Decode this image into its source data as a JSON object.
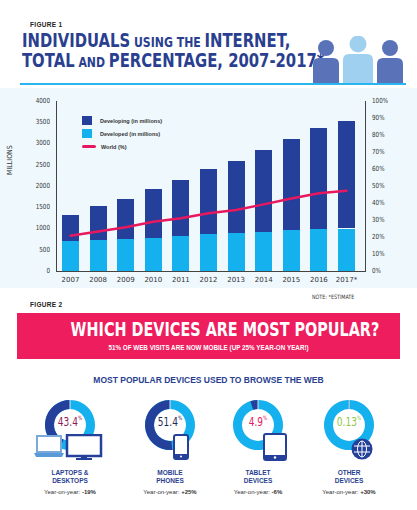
{
  "figure1": {
    "label": "FIGURE 1",
    "title_line1": [
      {
        "text": "INDIVIDUALS",
        "size": "big"
      },
      {
        "text": " USING THE ",
        "size": "small"
      },
      {
        "text": "INTERNET,",
        "size": "big"
      }
    ],
    "title_line2": [
      {
        "text": "TOTAL",
        "size": "big"
      },
      {
        "text": " AND ",
        "size": "small"
      },
      {
        "text": "PERCENTAGE, 2007-2017*",
        "size": "big"
      }
    ],
    "icon": "people-group-icon",
    "note": "NOTE: *ESTIMATE"
  },
  "chart_data": [
    {
      "type": "bar",
      "stacked": true,
      "title": "Individuals using the Internet, total and percentage, 2007-2017*",
      "categories": [
        "2007",
        "2008",
        "2009",
        "2010",
        "2011",
        "2012",
        "2013",
        "2014",
        "2015",
        "2016",
        "2017*"
      ],
      "ylabel": "MILLIONS",
      "ylim": [
        0,
        4000
      ],
      "yticks": [
        "0",
        "500",
        "1000",
        "1500",
        "2000",
        "2500",
        "3000",
        "3500",
        "4000"
      ],
      "y2lim": [
        0,
        100
      ],
      "y2ticks": [
        "0%",
        "10%",
        "20%",
        "30%",
        "40%",
        "50%",
        "60%",
        "70%",
        "80%",
        "90%",
        "100%"
      ],
      "legend_position": "upper-left",
      "grid": false,
      "series": [
        {
          "name": "Developed (in millions)",
          "type": "bar",
          "color": "#15b0ee",
          "values": [
            705,
            730,
            760,
            785,
            830,
            860,
            885,
            910,
            955,
            990,
            1000
          ]
        },
        {
          "name": "Developing (in millions)",
          "type": "bar",
          "color": "#24409a",
          "values": [
            615,
            800,
            930,
            1155,
            1300,
            1530,
            1705,
            1930,
            2145,
            2375,
            2535
          ]
        },
        {
          "name": "World (%)",
          "type": "line",
          "axis": "right",
          "color": "#e8185f",
          "values": [
            20.8,
            23.3,
            25.7,
            29.0,
            31.0,
            34.0,
            35.9,
            39.2,
            42.7,
            45.7,
            47.2
          ]
        }
      ],
      "note": "NOTE: *ESTIMATE"
    },
    {
      "type": "pie",
      "title": "Most popular devices used to browse the web",
      "categories": [
        "Laptops & Desktops",
        "Mobile Phones",
        "Tablet Devices",
        "Other Devices"
      ],
      "values": [
        43.4,
        51.4,
        4.9,
        0.13
      ],
      "year_on_year": [
        "-19%",
        "+25%",
        "-6%",
        "+30%"
      ]
    }
  ],
  "legend": [
    {
      "label": "Developing (in millions)",
      "color": "#24409a",
      "kind": "box"
    },
    {
      "label": "Developed (in millions)",
      "color": "#15b0ee",
      "kind": "box"
    },
    {
      "label": "World (%)",
      "color": "#e8185f",
      "kind": "line"
    }
  ],
  "figure2": {
    "label": "FIGURE 2",
    "banner_title": "WHICH DEVICES ARE MOST POPULAR?",
    "banner_subtitle": "51% OF WEB VISITS ARE NOW MOBILE (UP 25% YEAR-ON YEAR!)",
    "heading": "MOST POPULAR DEVICES USED TO BROWSE THE WEB",
    "yoy_prefix": "Year-on-year: ",
    "devices": [
      {
        "line1": "LAPTOPS &",
        "line2": "DESKTOPS",
        "pct": "43.4",
        "pct_color": "#8b1a57",
        "yoy": "-19%",
        "icon": "laptop-desktop-icon"
      },
      {
        "line1": "MOBILE",
        "line2": "PHONES",
        "pct": "51.4",
        "pct_color": "#1f2a5a",
        "yoy": "+25%",
        "icon": "smartphone-icon"
      },
      {
        "line1": "TABLET",
        "line2": "DEVICES",
        "pct": "4.9",
        "pct_color": "#e8185f",
        "yoy": "-6%",
        "icon": "tablet-icon"
      },
      {
        "line1": "OTHER",
        "line2": "DEVICES",
        "pct": "0.13",
        "pct_color": "#8dc63f",
        "yoy": "+30%",
        "icon": "globe-icon"
      }
    ]
  },
  "colors": {
    "dark_blue": "#24409a",
    "light_blue": "#15b0ee",
    "pink": "#ee1d5e",
    "title_blue": "#2a3f8f"
  }
}
